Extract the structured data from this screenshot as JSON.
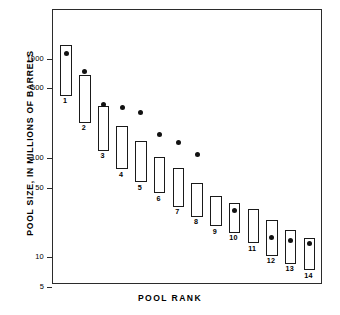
{
  "chart_data": {
    "type": "bar",
    "title": "",
    "xlabel": "POOL RANK",
    "ylabel": "POOL SIZE, IN MILLIONS OF BARRELS",
    "yscale": "log",
    "ylim": [
      5,
      1600
    ],
    "ytick_labels": [
      "1000",
      "500",
      "100",
      "50",
      "10",
      "5"
    ],
    "ytick_values": [
      1000,
      500,
      100,
      50,
      10,
      5
    ],
    "grid": false,
    "legend": null,
    "categories": [
      "1",
      "2",
      "3",
      "4",
      "5",
      "6",
      "7",
      "8",
      "9",
      "10",
      "11",
      "12",
      "13",
      "14"
    ],
    "series": [
      {
        "name": "Pool size range (box low-high)",
        "low": [
          430,
          230,
          120,
          78,
          58,
          45,
          33,
          26,
          21,
          18,
          14,
          10.5,
          8.8,
          7.5
        ],
        "high": [
          1400,
          690,
          340,
          215,
          150,
          105,
          80,
          57,
          42,
          36,
          31,
          24,
          19,
          16
        ]
      },
      {
        "name": "Estimated pool size (dot)",
        "values": [
          1150,
          750,
          350,
          330,
          290,
          175,
          145,
          110,
          null,
          30,
          null,
          16,
          15,
          14
        ]
      }
    ]
  },
  "axes": {
    "y_label_text": "POOL SIZE, IN MILLIONS OF BARRELS",
    "x_label_text": "POOL RANK"
  }
}
